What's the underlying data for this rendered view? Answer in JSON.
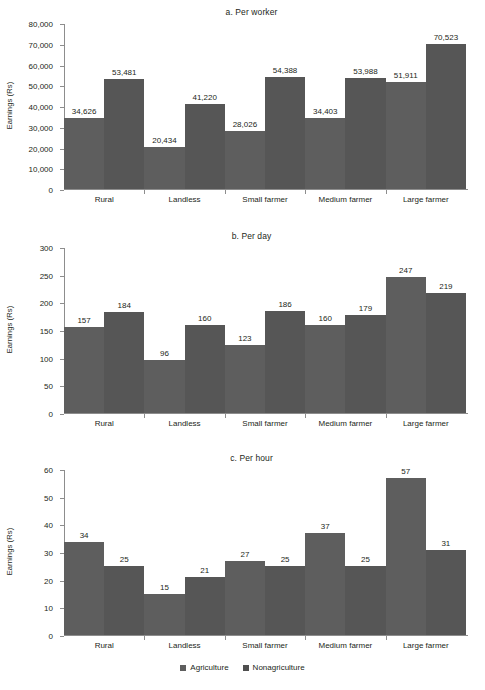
{
  "figure": {
    "clipped_header_text": "",
    "clipped_footer_text": "",
    "legend": {
      "items": [
        {
          "label": "Agriculture",
          "color": "#5e5e5e",
          "icon": "square-swatch-icon"
        },
        {
          "label": "Nonagriculture",
          "color": "#4f4f4f",
          "icon": "square-swatch-icon"
        }
      ]
    }
  },
  "chart_data": [
    {
      "type": "bar",
      "title": "a. Per worker",
      "xlabel": "",
      "ylabel": "Earnings (Rs)",
      "ylim": [
        0,
        80000
      ],
      "yticks": [
        0,
        10000,
        20000,
        30000,
        40000,
        50000,
        60000,
        70000,
        80000
      ],
      "ytick_labels": [
        "0",
        "10,000",
        "20,000",
        "30,000",
        "40,000",
        "50,000",
        "60,000",
        "70,000",
        "80,000"
      ],
      "grid": false,
      "legend_position": "bottom",
      "categories": [
        "Rural",
        "Landless",
        "Small farmer",
        "Medium farmer",
        "Large farmer"
      ],
      "series": [
        {
          "name": "Agriculture",
          "values": [
            34626,
            20434,
            28026,
            34403,
            51911
          ],
          "labels": [
            "34,626",
            "20,434",
            "28,026",
            "34,403",
            "51,911"
          ]
        },
        {
          "name": "Nonagriculture",
          "values": [
            53481,
            41220,
            54388,
            53988,
            70523
          ],
          "labels": [
            "53,481",
            "41,220",
            "54,388",
            "53,988",
            "70,523"
          ]
        }
      ]
    },
    {
      "type": "bar",
      "title": "b. Per day",
      "xlabel": "",
      "ylabel": "Earnings (Rs)",
      "ylim": [
        0,
        300
      ],
      "yticks": [
        0,
        50,
        100,
        150,
        200,
        250,
        300
      ],
      "ytick_labels": [
        "0",
        "50",
        "100",
        "150",
        "200",
        "250",
        "300"
      ],
      "grid": false,
      "legend_position": "bottom",
      "categories": [
        "Rural",
        "Landless",
        "Small farmer",
        "Medium farmer",
        "Large farmer"
      ],
      "series": [
        {
          "name": "Agriculture",
          "values": [
            157,
            96,
            123,
            160,
            247
          ],
          "labels": [
            "157",
            "96",
            "123",
            "160",
            "247"
          ]
        },
        {
          "name": "Nonagriculture",
          "values": [
            184,
            160,
            186,
            179,
            219
          ],
          "labels": [
            "184",
            "160",
            "186",
            "179",
            "219"
          ]
        }
      ]
    },
    {
      "type": "bar",
      "title": "c. Per hour",
      "xlabel": "",
      "ylabel": "Earnings (Rs)",
      "ylim": [
        0,
        60
      ],
      "yticks": [
        0,
        10,
        20,
        30,
        40,
        50,
        60
      ],
      "ytick_labels": [
        "0",
        "10",
        "20",
        "30",
        "40",
        "50",
        "60"
      ],
      "grid": false,
      "legend_position": "bottom",
      "categories": [
        "Rural",
        "Landless",
        "Small farmer",
        "Medium farmer",
        "Large farmer"
      ],
      "series": [
        {
          "name": "Agriculture",
          "values": [
            34,
            15,
            27,
            37,
            57
          ],
          "labels": [
            "34",
            "15",
            "27",
            "37",
            "57"
          ]
        },
        {
          "name": "Nonagriculture",
          "values": [
            25,
            21,
            25,
            25,
            31
          ],
          "labels": [
            "25",
            "21",
            "25",
            "25",
            "31"
          ]
        }
      ]
    }
  ]
}
